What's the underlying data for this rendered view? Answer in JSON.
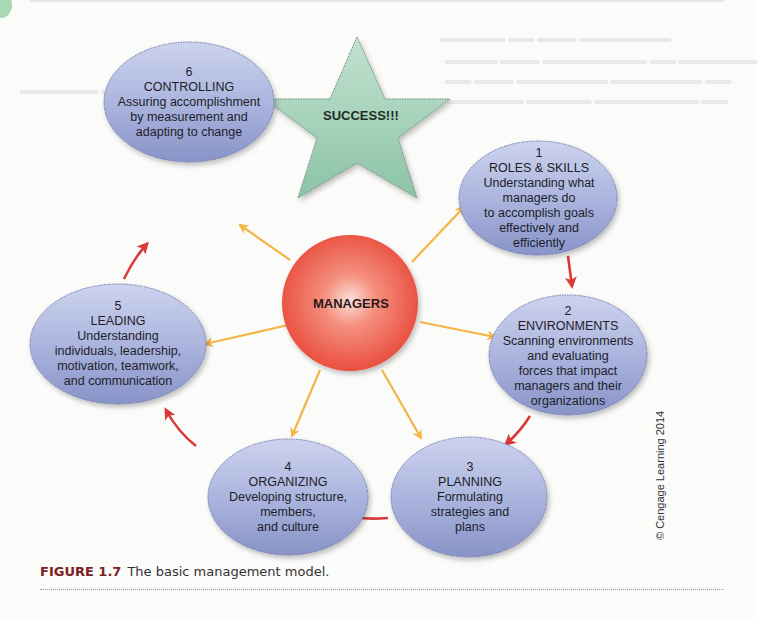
{
  "figure": {
    "label": "FIGURE 1.7",
    "caption": "The basic management model.",
    "copyright": "© Cengage Learning 2014"
  },
  "center": {
    "label": "MANAGERS",
    "color": "#ee5a4a"
  },
  "goal": {
    "label": "SUCCESS!!!",
    "color": "#a8d4bc"
  },
  "nodes": [
    {
      "number": "1",
      "title": "ROLES & SKILLS",
      "lines": [
        "Understanding what",
        "managers do",
        "to accomplish goals",
        "effectively and",
        "efficiently"
      ]
    },
    {
      "number": "2",
      "title": "ENVIRONMENTS",
      "lines": [
        "Scanning environments",
        "and evaluating",
        "forces that impact",
        "managers and their",
        "organizations"
      ]
    },
    {
      "number": "3",
      "title": "PLANNING",
      "lines": [
        "Formulating",
        "strategies and",
        "plans"
      ]
    },
    {
      "number": "4",
      "title": "ORGANIZING",
      "lines": [
        "Developing structure,",
        "members,",
        "and culture"
      ]
    },
    {
      "number": "5",
      "title": "LEADING",
      "lines": [
        "Understanding",
        "individuals, leadership,",
        "motivation, teamwork,",
        "and communication"
      ]
    },
    {
      "number": "6",
      "title": "CONTROLLING",
      "lines": [
        "Assuring accomplishment",
        "by measurement and",
        "adapting to change"
      ]
    }
  ],
  "colors": {
    "node_fill": "#a9b3dc",
    "spoke_arrow": "#f4b545",
    "cycle_arrow": "#d83a3a"
  }
}
